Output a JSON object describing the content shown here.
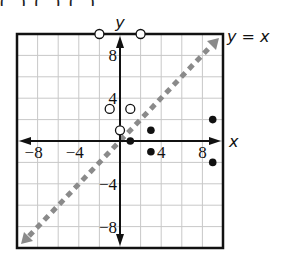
{
  "header_fragment": "(  ,  ),  (  ,  ),  (  ,  ),",
  "chart_data": {
    "type": "scatter",
    "title": "",
    "xlabel": "x",
    "ylabel": "y",
    "xlim": [
      -10,
      10
    ],
    "ylim": [
      -10,
      10
    ],
    "grid": true,
    "grid_step": 2,
    "x_ticks": [
      -8,
      -4,
      4,
      8
    ],
    "y_ticks": [
      8,
      4,
      -4,
      -8
    ],
    "x_tick_labels": [
      "−8",
      "−4",
      "4",
      "8"
    ],
    "y_tick_labels": [
      "8",
      "4",
      "−4",
      "−8"
    ],
    "series": [
      {
        "name": "open points",
        "marker": "open-circle",
        "points": [
          [
            -2,
            10
          ],
          [
            2,
            10
          ],
          [
            -1,
            3
          ],
          [
            1,
            3
          ],
          [
            0,
            1
          ]
        ]
      },
      {
        "name": "closed points",
        "marker": "filled-circle",
        "points": [
          [
            1,
            0
          ],
          [
            3,
            1
          ],
          [
            3,
            -1
          ],
          [
            9,
            2
          ],
          [
            9,
            -2
          ]
        ]
      }
    ],
    "reference_line": {
      "label": "y = x",
      "style": "dashed",
      "color": "#888888",
      "from": [
        -10,
        -10
      ],
      "to": [
        10,
        10
      ]
    }
  },
  "colors": {
    "axis": "#111111",
    "grid": "#c8c8c8",
    "frame": "#111111",
    "line": "#8a8a8a",
    "point": "#111111"
  }
}
